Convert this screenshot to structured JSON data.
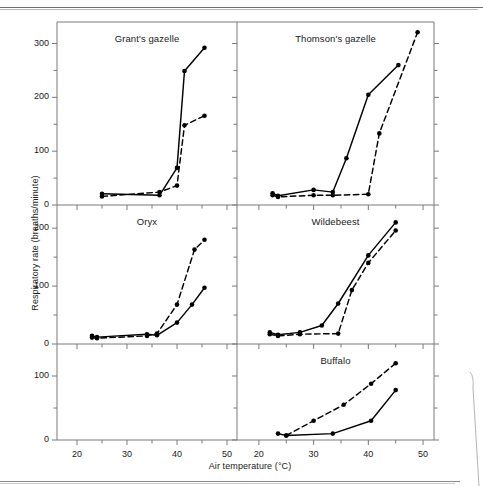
{
  "figure": {
    "y_axis_title": "Respiratory rate (breaths/minute)",
    "x_axis_title": "Air temperature (°C)",
    "x_tick_labels": [
      "20",
      "30",
      "40",
      "50"
    ],
    "x_ticks": [
      20,
      30,
      40,
      50
    ],
    "x_minor_ticks": [
      25,
      35,
      45
    ],
    "xlim": [
      16,
      52
    ],
    "line_color": "#000000",
    "axis_color": "#7a7a7a"
  },
  "chart_data": [
    {
      "type": "line",
      "title": "Grant's gazelle",
      "panel": "top-left",
      "xlabel": "Air temperature (°C)",
      "ylabel": "Respiratory rate (breaths/minute)",
      "xlim": [
        16,
        52
      ],
      "ylim": [
        0,
        340
      ],
      "y_tick_labels": [
        "0",
        "100",
        "200",
        "300"
      ],
      "y_ticks": [
        0,
        100,
        200,
        300
      ],
      "y_minor_ticks": [
        50,
        150,
        250
      ],
      "grid": false,
      "legend": "none",
      "series": [
        {
          "name": "solid",
          "style": "solid",
          "x": [
            25.0,
            36.5,
            40.0,
            41.5,
            45.5
          ],
          "y": [
            21,
            18,
            69,
            249,
            292
          ]
        },
        {
          "name": "dashed",
          "style": "dashed",
          "x": [
            25.0,
            36.5,
            40.0,
            41.5,
            45.5
          ],
          "y": [
            16,
            24,
            36,
            148,
            166
          ]
        }
      ]
    },
    {
      "type": "line",
      "title": "Thomson's gazelle",
      "panel": "top-right",
      "xlim": [
        16,
        52
      ],
      "ylim": [
        0,
        340
      ],
      "y_tick_labels": [],
      "y_ticks": [
        0,
        100,
        200,
        300
      ],
      "y_minor_ticks": [
        50,
        150,
        250
      ],
      "grid": false,
      "legend": "none",
      "series": [
        {
          "name": "solid",
          "style": "solid",
          "x": [
            22.5,
            23.5,
            30.0,
            33.5,
            36.0,
            40.0,
            45.5
          ],
          "y": [
            22,
            17,
            28,
            24,
            87,
            205,
            260
          ]
        },
        {
          "name": "dashed",
          "style": "dashed",
          "x": [
            22.5,
            23.5,
            30.0,
            33.5,
            40.0,
            42.0,
            49.0
          ],
          "y": [
            18,
            15,
            18,
            18,
            20,
            133,
            321
          ]
        }
      ]
    },
    {
      "type": "line",
      "title": "Oryx",
      "panel": "middle-left",
      "xlim": [
        16,
        52
      ],
      "ylim": [
        0,
        240
      ],
      "y_tick_labels": [
        "0",
        "100",
        "200"
      ],
      "y_ticks": [
        0,
        100,
        200
      ],
      "y_minor_ticks": [
        50,
        150
      ],
      "grid": false,
      "legend": "none",
      "series": [
        {
          "name": "solid",
          "style": "solid",
          "x": [
            23.0,
            24.0,
            34.0,
            36.0,
            40.0,
            43.0,
            45.5
          ],
          "y": [
            14,
            12,
            17,
            15,
            37,
            68,
            97
          ]
        },
        {
          "name": "dashed",
          "style": "dashed",
          "x": [
            23.0,
            24.0,
            34.0,
            36.0,
            40.0,
            43.5,
            45.5
          ],
          "y": [
            11,
            10,
            14,
            18,
            68,
            163,
            180
          ]
        }
      ]
    },
    {
      "type": "line",
      "title": "Wildebeest",
      "panel": "middle-right",
      "xlim": [
        16,
        52
      ],
      "ylim": [
        0,
        240
      ],
      "y_tick_labels": [],
      "y_ticks": [
        0,
        100,
        200
      ],
      "y_minor_ticks": [
        50,
        150
      ],
      "grid": false,
      "legend": "none",
      "series": [
        {
          "name": "solid",
          "style": "solid",
          "x": [
            22.0,
            23.5,
            27.5,
            31.5,
            34.5,
            40.0,
            45.0
          ],
          "y": [
            20,
            16,
            20,
            32,
            70,
            153,
            210
          ]
        },
        {
          "name": "dashed",
          "style": "dashed",
          "x": [
            22.0,
            23.5,
            27.5,
            34.5,
            37.0,
            40.0,
            45.0
          ],
          "y": [
            17,
            14,
            17,
            18,
            93,
            140,
            196
          ]
        }
      ]
    },
    {
      "type": "line",
      "title": "",
      "panel": "bottom-left",
      "xlim": [
        16,
        52
      ],
      "ylim": [
        0,
        150
      ],
      "y_tick_labels": [
        "0",
        "100"
      ],
      "y_ticks": [
        0,
        100
      ],
      "y_minor_ticks": [
        50
      ],
      "grid": false,
      "legend": "none",
      "series": []
    },
    {
      "type": "line",
      "title": "Buffalo",
      "panel": "bottom-right",
      "xlim": [
        16,
        52
      ],
      "ylim": [
        0,
        150
      ],
      "y_tick_labels": [],
      "y_ticks": [
        0,
        100
      ],
      "y_minor_ticks": [
        50
      ],
      "grid": false,
      "legend": "none",
      "series": [
        {
          "name": "solid",
          "style": "solid",
          "x": [
            23.5,
            25.0,
            33.5,
            40.5,
            45.0
          ],
          "y": [
            10,
            7,
            10,
            30,
            78
          ]
        },
        {
          "name": "dashed",
          "style": "dashed",
          "x": [
            25.0,
            30.0,
            35.5,
            40.5,
            45.0
          ],
          "y": [
            7,
            30,
            55,
            88,
            120
          ]
        }
      ]
    }
  ]
}
